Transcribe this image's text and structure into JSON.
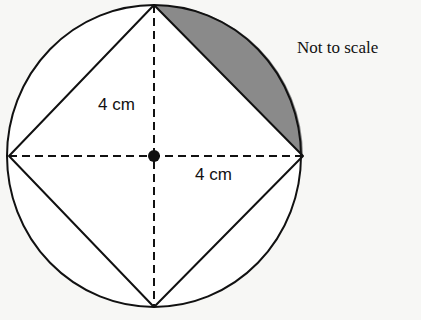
{
  "diagram": {
    "note": "Not to scale",
    "labels": {
      "vertical_radius": "4 cm",
      "horizontal_radius": "4 cm"
    },
    "shapes": {
      "circle": {
        "cx": 154,
        "cy": 156,
        "rx": 147,
        "ry": 151
      },
      "square_vertices": {
        "top": [
          154,
          5
        ],
        "right": [
          303,
          156
        ],
        "bottom": [
          154,
          307
        ],
        "left": [
          9,
          156
        ]
      },
      "center_point": [
        154,
        156
      ],
      "shaded_region": "segment between top and right vertices"
    },
    "colors": {
      "stroke": "#111111",
      "shade": "#8a8a8a",
      "background": "#f7f7f5"
    }
  }
}
